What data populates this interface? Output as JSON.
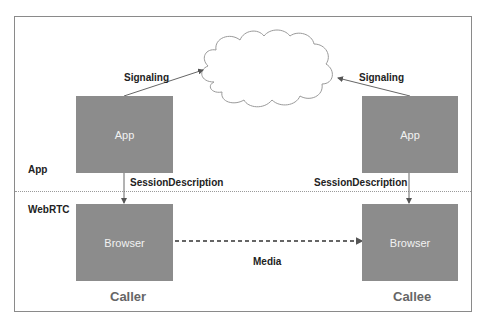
{
  "diagram": {
    "layers": {
      "app_label": "App",
      "webrtc_label": "WebRTC"
    },
    "signaling_left": "Signaling",
    "signaling_right": "Signaling",
    "caller": {
      "app_box": "App",
      "session_description": "SessionDescription",
      "browser_box": "Browser",
      "label": "Caller"
    },
    "callee": {
      "app_box": "App",
      "session_description": "SessionDescription",
      "browser_box": "Browser",
      "label": "Callee"
    },
    "media_label": "Media",
    "cloud": "signaling-server-cloud",
    "colors": {
      "box_fill": "#8c8c8c",
      "box_text": "#f2f2f2",
      "frame": "#8a8a8a",
      "label_text": "#222222",
      "party_text": "#666666"
    }
  }
}
